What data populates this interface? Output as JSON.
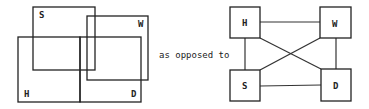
{
  "left_diagram": {
    "description": "Overlapping rectangles",
    "boxes": [
      {
        "label": "S",
        "x": 33,
        "y": 7,
        "w": 62,
        "h": 63
      },
      {
        "label": "W",
        "x": 87,
        "y": 16,
        "w": 61,
        "h": 64
      },
      {
        "label": "H",
        "x": 18,
        "y": 37,
        "w": 62,
        "h": 65
      },
      {
        "label": "D",
        "x": 80,
        "y": 37,
        "w": 61,
        "h": 65
      }
    ]
  },
  "connector_text": "as opposed to",
  "right_diagram": {
    "description": "Fully connected graph of four nodes",
    "nodes": [
      {
        "label": "H",
        "x": 230,
        "y": 7,
        "w": 30,
        "h": 31
      },
      {
        "label": "W",
        "x": 320,
        "y": 7,
        "w": 31,
        "h": 31
      },
      {
        "label": "S",
        "x": 230,
        "y": 70,
        "w": 30,
        "h": 31
      },
      {
        "label": "D",
        "x": 321,
        "y": 69,
        "w": 30,
        "h": 32
      }
    ],
    "edges": [
      [
        "H",
        "W"
      ],
      [
        "H",
        "S"
      ],
      [
        "H",
        "D"
      ],
      [
        "W",
        "S"
      ],
      [
        "W",
        "D"
      ],
      [
        "S",
        "D"
      ]
    ]
  },
  "colors": {
    "line": "#222222",
    "background": "#ffffff"
  }
}
